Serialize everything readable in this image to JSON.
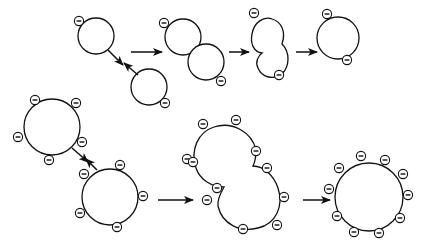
{
  "diagram": {
    "colors": {
      "stroke": "#111111",
      "fill": "#ffffff",
      "background": "#ffffff"
    },
    "charge_symbol": "⊖",
    "rows": [
      {
        "name": "small-vesicle-fusion",
        "stages": [
          {
            "stage": "approach",
            "vesicles": [
              {
                "cx": 96,
                "cy": 36,
                "r": 18,
                "charges": [
                  [
                    79,
                    21
                  ]
                ]
              },
              {
                "cx": 149,
                "cy": 87,
                "r": 18,
                "charges": [
                  [
                    165,
                    103
                  ]
                ]
              }
            ]
          },
          {
            "stage": "contact",
            "vesicles": [
              {
                "cx": 183,
                "cy": 37,
                "r": 18,
                "charges": [
                  [
                    164,
                    23
                  ]
                ]
              },
              {
                "cx": 206,
                "cy": 62,
                "r": 18,
                "charges": [
                  [
                    221,
                    81
                  ]
                ]
              }
            ]
          },
          {
            "stage": "fusing",
            "charges": [
              [
                254,
                13
              ],
              [
                279,
                75
              ]
            ]
          },
          {
            "stage": "fused",
            "vesicles": [
              {
                "cx": 338,
                "cy": 38,
                "r": 21,
                "charges": [
                  [
                    327,
                    14
                  ],
                  [
                    347,
                    60
                  ]
                ]
              }
            ]
          }
        ]
      },
      {
        "name": "large-vesicle-fusion",
        "stages": [
          {
            "stage": "approach",
            "vesicles": [
              {
                "cx": 52,
                "cy": 127,
                "r": 28,
                "charges": [
                  [
                    35,
                    100
                  ],
                  [
                    76,
                    103
                  ],
                  [
                    18,
                    137
                  ],
                  [
                    49,
                    160
                  ],
                  [
                    82,
                    142
                  ]
                ]
              },
              {
                "cx": 110,
                "cy": 197,
                "r": 28,
                "charges": [
                  [
                    84,
                    174
                  ],
                  [
                    120,
                    165
                  ],
                  [
                    143,
                    196
                  ],
                  [
                    80,
                    213
                  ],
                  [
                    117,
                    227
                  ]
                ]
              }
            ]
          },
          {
            "stage": "fusing",
            "charges": [
              [
                203,
                124
              ],
              [
                236,
                120
              ],
              [
                256,
                151
              ],
              [
                267,
                168
              ],
              [
                284,
                197
              ],
              [
                277,
                225
              ],
              [
                243,
                229
              ],
              [
                217,
                188
              ],
              [
                207,
                200
              ],
              [
                187,
                159
              ],
              [
                193,
                162
              ]
            ]
          },
          {
            "stage": "fused",
            "vesicles": [
              {
                "cx": 369,
                "cy": 197,
                "r": 34,
                "charges": [
                  [
                    361,
                    156
                  ],
                  [
                    385,
                    160
                  ],
                  [
                    403,
                    174
                  ],
                  [
                    408,
                    195
                  ],
                  [
                    400,
                    218
                  ],
                  [
                    379,
                    233
                  ],
                  [
                    354,
                    232
                  ],
                  [
                    337,
                    216
                  ],
                  [
                    329,
                    189
                  ],
                  [
                    339,
                    168
                  ]
                ]
              }
            ]
          }
        ]
      }
    ],
    "arrows": [
      {
        "name": "approach-arrow-top-a",
        "from": [
          108,
          50
        ],
        "to": [
          123,
          65
        ]
      },
      {
        "name": "approach-arrow-top-b",
        "from": [
          138,
          75
        ],
        "to": [
          124,
          63
        ]
      },
      {
        "name": "step-arrow-top-1",
        "from": [
          131,
          52
        ],
        "to": [
          162,
          52
        ]
      },
      {
        "name": "step-arrow-top-2",
        "from": [
          229,
          52
        ],
        "to": [
          249,
          52
        ]
      },
      {
        "name": "step-arrow-top-3",
        "from": [
          296,
          52
        ],
        "to": [
          317,
          52
        ]
      },
      {
        "name": "approach-arrow-bottom-a",
        "from": [
          72,
          148
        ],
        "to": [
          88,
          162
        ]
      },
      {
        "name": "approach-arrow-bottom-b",
        "from": [
          97,
          170
        ],
        "to": [
          86,
          159
        ]
      },
      {
        "name": "step-arrow-bottom-1",
        "from": [
          158,
          200
        ],
        "to": [
          193,
          200
        ]
      },
      {
        "name": "step-arrow-bottom-2",
        "from": [
          303,
          200
        ],
        "to": [
          330,
          200
        ]
      }
    ]
  }
}
